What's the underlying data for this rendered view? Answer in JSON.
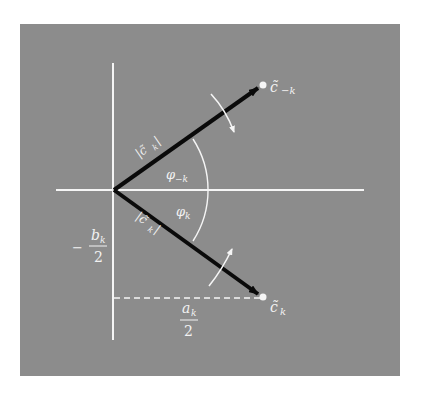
{
  "figure": {
    "background": "#ffffff",
    "panel_color": "#8c8c8c",
    "axis_color": "#f5f5f5",
    "vector_color": "#0a0a0a",
    "labels": {
      "c_minus_k": "c̃",
      "c_minus_k_sub": "−k",
      "c_k": "c̃",
      "c_k_sub": "k",
      "mag_upper": "|c̃",
      "mag_upper_sub": "k",
      "mag_upper_close": "|",
      "mag_lower": "|c̃",
      "mag_lower_sub": "k",
      "mag_lower_close": "|",
      "phi_minus_k": "φ",
      "phi_minus_k_sub": "−k",
      "phi_k": "φ",
      "phi_k_sub": "k",
      "b_num": "b",
      "b_sub": "k",
      "b_den": "2",
      "b_sign": "−",
      "a_num": "a",
      "a_sub": "k",
      "a_den": "2"
    }
  }
}
